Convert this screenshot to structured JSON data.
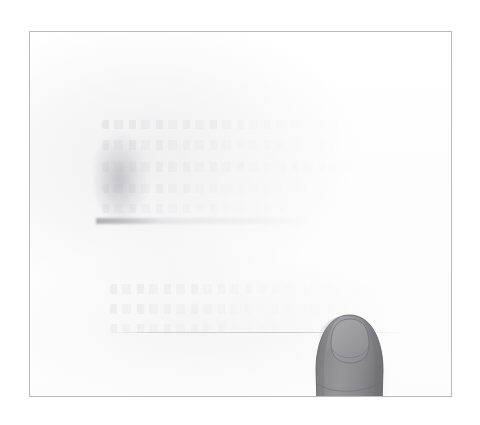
{
  "scene": {
    "kind": "scanned-document-photo",
    "background_color": "#ffffff",
    "width": 480,
    "height": 425,
    "caption": ""
  },
  "frame": {
    "label": "",
    "border_color": "#b9b9b9",
    "paper_color": "#fefefe",
    "left": 29,
    "top": 31,
    "width": 423,
    "height": 366
  },
  "content": {
    "upper_block": {
      "label": "",
      "legible": "false",
      "line_count": 5
    },
    "lower_block": {
      "label": "",
      "legible": "false",
      "line_count": 3
    },
    "ruled_line": {
      "label": ""
    },
    "smudge": {
      "label": "",
      "color": "#92929 8"
    }
  },
  "fingertip": {
    "label": "",
    "description": "",
    "skin_color": "#8d8d8f",
    "skin_shadow_color": "#6f6f72",
    "nail_color": "#a2a2a4",
    "outline_color": "#5f5f62",
    "position": "bottom-right",
    "pointing": "up"
  }
}
